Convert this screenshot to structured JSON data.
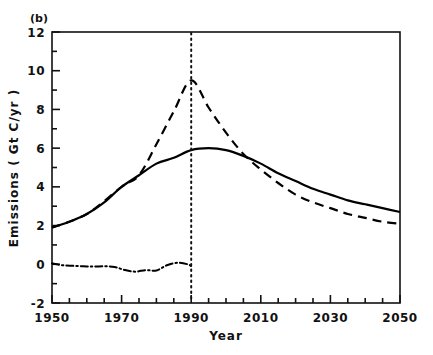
{
  "panel": {
    "label": "(b)"
  },
  "axes": {
    "x_title": "Year",
    "y_title": "Emissions ( Gt C/yr )",
    "x_ticks": [
      "1950",
      "1970",
      "1990",
      "2010",
      "2030",
      "2050"
    ],
    "y_ticks": [
      "12",
      "10",
      "8",
      "6",
      "4",
      "2",
      "0",
      "-2"
    ]
  },
  "chart_data": {
    "type": "line",
    "title": "(b)",
    "xlabel": "Year",
    "ylabel": "Emissions ( Gt C/yr )",
    "xlim": [
      1950,
      2050
    ],
    "ylim": [
      -2,
      12
    ],
    "x_major_tick_step": 20,
    "x_minor_tick_step": 5,
    "y_major_tick_step": 2,
    "y_minor_tick_step": 1,
    "grid": false,
    "legend": null,
    "annotations": [
      {
        "type": "vertical-line",
        "x": 1990,
        "style": "dotted",
        "label": "1990 reference year"
      }
    ],
    "series": [
      {
        "name": "Fossil fuel emissions (solid)",
        "style": "solid",
        "color": "#000000",
        "x": [
          1950,
          1955,
          1960,
          1965,
          1970,
          1975,
          1980,
          1985,
          1990,
          1995,
          2000,
          2005,
          2010,
          2015,
          2020,
          2025,
          2030,
          2035,
          2040,
          2045,
          2050
        ],
        "values": [
          1.9,
          2.2,
          2.6,
          3.2,
          4.0,
          4.6,
          5.2,
          5.5,
          5.9,
          6.0,
          5.9,
          5.6,
          5.2,
          4.7,
          4.3,
          3.9,
          3.6,
          3.3,
          3.1,
          2.9,
          2.7
        ]
      },
      {
        "name": "Alternative high scenario (dashed)",
        "style": "dashed",
        "color": "#000000",
        "x": [
          1950,
          1960,
          1970,
          1975,
          1980,
          1985,
          1990,
          1995,
          2000,
          2005,
          2010,
          2015,
          2020,
          2025,
          2030,
          2035,
          2040,
          2045,
          2050
        ],
        "values": [
          1.9,
          2.6,
          4.0,
          4.6,
          6.2,
          7.9,
          9.5,
          8.1,
          6.8,
          5.7,
          4.9,
          4.2,
          3.6,
          3.2,
          2.9,
          2.6,
          2.4,
          2.2,
          2.1
        ]
      },
      {
        "name": "Land-use / net flux (dash-dot)",
        "style": "dash-dot",
        "color": "#000000",
        "x": [
          1950,
          1953,
          1956,
          1959,
          1962,
          1965,
          1968,
          1971,
          1974,
          1977,
          1980,
          1983,
          1986,
          1989,
          1990
        ],
        "values": [
          0.05,
          -0.05,
          -0.08,
          -0.1,
          -0.12,
          -0.1,
          -0.14,
          -0.3,
          -0.38,
          -0.3,
          -0.32,
          -0.05,
          0.08,
          0.0,
          -0.1
        ]
      }
    ]
  }
}
